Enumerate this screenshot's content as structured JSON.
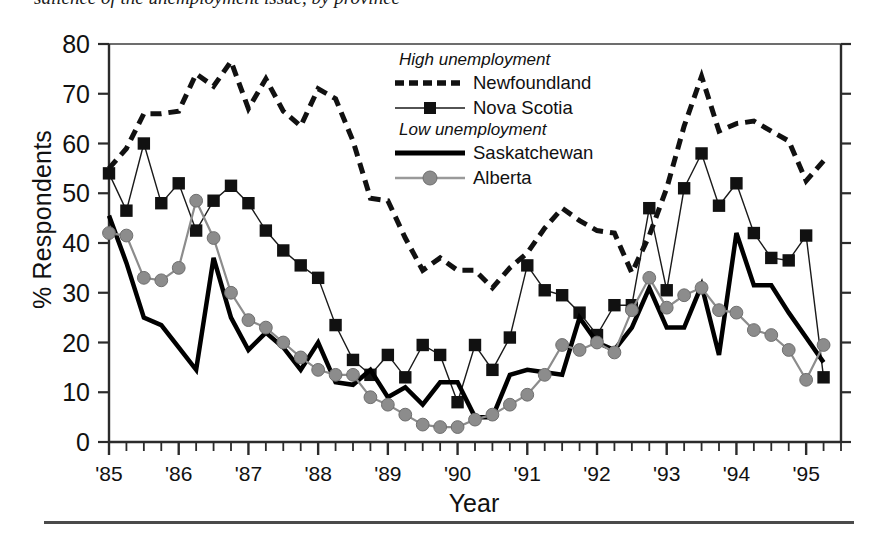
{
  "caption": {
    "text": "salience of the unemployment issue, by province"
  },
  "legend": {
    "group_high": "High unemployment",
    "group_low": "Low unemployment",
    "entries": [
      {
        "label": "Newfoundland",
        "style": "dashed-thick",
        "color": "#111111",
        "marker": "none"
      },
      {
        "label": "Nova Scotia",
        "style": "thin-line",
        "color": "#1a1a1a",
        "marker": "square"
      },
      {
        "label": "Saskatchewan",
        "style": "solid-thick",
        "color": "#000000",
        "marker": "none"
      },
      {
        "label": "Alberta",
        "style": "thin-line",
        "color": "#8c8c8c",
        "marker": "circle"
      }
    ]
  },
  "axes": {
    "y_title": "% Respondents",
    "x_title": "Year"
  },
  "chart_data": {
    "type": "line",
    "title": "salience of the unemployment issue, by province",
    "xlabel": "Year",
    "ylabel": "% Respondents",
    "ylim": [
      0,
      80
    ],
    "yticks": [
      0,
      10,
      20,
      30,
      40,
      50,
      60,
      70,
      80
    ],
    "xlim": [
      1985.0,
      1995.5
    ],
    "xticks": [
      1985,
      1986,
      1987,
      1988,
      1989,
      1990,
      1991,
      1992,
      1993,
      1994,
      1995
    ],
    "xticklabels": [
      "'85",
      "'86",
      "'87",
      "'88",
      "'89",
      "'90",
      "'91",
      "'92",
      "'93",
      "'94",
      "'95"
    ],
    "minor_tick_interval": 0.25,
    "grid": false,
    "legend_position": "upper-center-right",
    "x": [
      1985.0,
      1985.25,
      1985.5,
      1985.75,
      1986.0,
      1986.25,
      1986.5,
      1986.75,
      1987.0,
      1987.25,
      1987.5,
      1987.75,
      1988.0,
      1988.25,
      1988.5,
      1988.75,
      1989.0,
      1989.25,
      1989.5,
      1989.75,
      1990.0,
      1990.25,
      1990.5,
      1990.75,
      1991.0,
      1991.25,
      1991.5,
      1991.75,
      1992.0,
      1992.25,
      1992.5,
      1992.75,
      1993.0,
      1993.25,
      1993.5,
      1993.75,
      1994.0,
      1994.25,
      1994.5,
      1994.75,
      1995.0,
      1995.25
    ],
    "series": [
      {
        "name": "Newfoundland",
        "group": "High unemployment",
        "color": "#111111",
        "linestyle": "dashed",
        "linewidth": 5,
        "marker": "none",
        "values": [
          55.0,
          59.0,
          66.0,
          66.0,
          66.5,
          74.0,
          71.5,
          76.5,
          67.0,
          73.0,
          66.5,
          63.5,
          71.0,
          69.0,
          60.5,
          49.0,
          48.5,
          41.0,
          34.5,
          37.0,
          34.5,
          34.5,
          31.0,
          35.0,
          38.0,
          43.0,
          47.0,
          44.5,
          42.5,
          42.0,
          34.0,
          41.5,
          51.0,
          63.5,
          73.5,
          62.5,
          64.0,
          64.5,
          62.5,
          60.5,
          52.5,
          56.5
        ]
      },
      {
        "name": "Nova Scotia",
        "group": "High unemployment",
        "color": "#1a1a1a",
        "linestyle": "solid",
        "linewidth": 1.4,
        "marker": "square",
        "values": [
          54.0,
          46.5,
          60.0,
          48.0,
          52.0,
          42.5,
          48.5,
          51.5,
          48.0,
          42.5,
          38.5,
          35.5,
          33.0,
          23.5,
          16.5,
          13.5,
          17.5,
          13.0,
          19.5,
          17.5,
          8.0,
          19.5,
          14.5,
          21.0,
          35.5,
          30.5,
          29.5,
          26.0,
          21.5,
          27.5,
          27.5,
          47.0,
          30.5,
          51.0,
          58.0,
          47.5,
          52.0,
          42.0,
          37.0,
          36.5,
          41.5,
          13.0
        ]
      },
      {
        "name": "Saskatchewan",
        "group": "Low unemployment",
        "color": "#000000",
        "linestyle": "solid",
        "linewidth": 4.5,
        "marker": "none",
        "values": [
          45.5,
          36.0,
          25.0,
          23.5,
          19.0,
          14.5,
          37.0,
          25.0,
          18.5,
          22.0,
          19.0,
          14.5,
          20.0,
          12.0,
          11.5,
          14.5,
          9.0,
          11.0,
          7.5,
          12.0,
          12.0,
          5.0,
          5.0,
          13.5,
          14.5,
          14.0,
          13.5,
          25.0,
          20.0,
          18.5,
          23.0,
          31.0,
          23.0,
          23.0,
          31.5,
          17.5,
          42.0,
          31.5,
          31.5,
          26.0,
          21.0,
          16.0
        ]
      },
      {
        "name": "Alberta",
        "group": "Low unemployment",
        "color": "#8c8c8c",
        "linestyle": "solid",
        "linewidth": 2.2,
        "marker": "circle",
        "values": [
          42.0,
          41.5,
          33.0,
          32.5,
          35.0,
          48.5,
          41.0,
          30.0,
          24.5,
          23.0,
          20.0,
          17.0,
          14.5,
          13.5,
          13.5,
          9.0,
          7.5,
          5.5,
          3.5,
          3.0,
          3.0,
          4.5,
          5.5,
          7.5,
          9.5,
          13.5,
          19.5,
          18.5,
          20.0,
          18.0,
          26.5,
          33.0,
          27.0,
          29.5,
          31.0,
          26.5,
          26.0,
          22.5,
          21.5,
          18.5,
          12.5,
          19.5
        ]
      }
    ]
  }
}
